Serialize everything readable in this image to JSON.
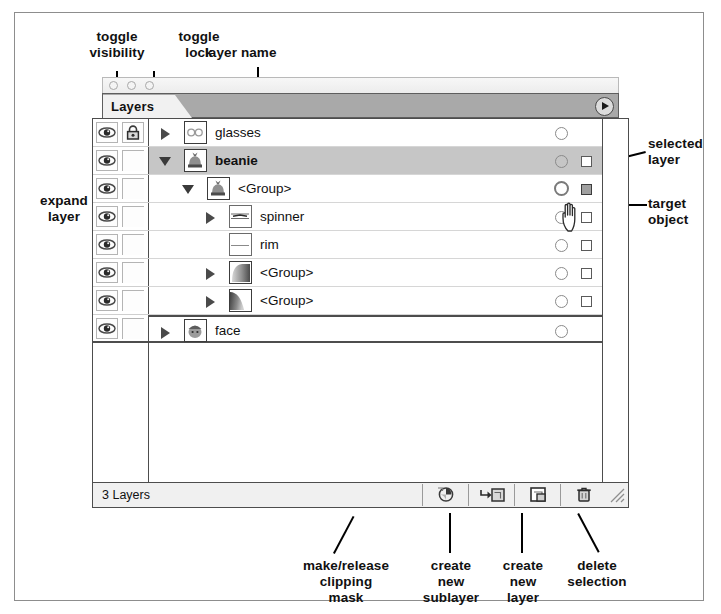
{
  "figure": {
    "application": "Adobe Illustrator Layers palette",
    "annotations": {
      "toggle_visibility": "toggle\nvisibility",
      "toggle_lock": "toggle\nlock",
      "layer_name": "layer name",
      "expand_layer": "expand\nlayer",
      "selected_layer": "selected\nlayer",
      "target_object": "target\nobject",
      "make_release_clipping_mask": "make/release\nclipping\nmask",
      "create_new_sublayer": "create\nnew\nsublayer",
      "create_new_layer": "create\nnew\nlayer",
      "delete_selection": "delete\nselection"
    }
  },
  "palette": {
    "tab_label": "Layers",
    "menu_arrow_icon": "triangle-right-icon",
    "window_dots": [
      "close-dot",
      "zoom-dot",
      "collapse-dot"
    ],
    "footer": {
      "layer_count": "3 Layers",
      "buttons": [
        {
          "name": "make-release-clipping-mask",
          "icon": "clipping-mask-icon"
        },
        {
          "name": "create-new-sublayer",
          "icon": "new-sublayer-icon"
        },
        {
          "name": "create-new-layer",
          "icon": "new-layer-icon"
        },
        {
          "name": "delete-selection",
          "icon": "trash-icon"
        }
      ],
      "resize_grip_icon": "resize-grip-icon"
    }
  },
  "layers": [
    {
      "name": "glasses",
      "indent": 0,
      "disclosure": "collapsed",
      "visible": true,
      "locked": true,
      "selected": false,
      "bold": false,
      "thumbnail": "glasses-thumbnail",
      "has_target_circle": true,
      "target_active": false,
      "has_selection_square": false,
      "selection_square_filled": false
    },
    {
      "name": "beanie",
      "indent": 0,
      "disclosure": "expanded",
      "visible": true,
      "locked": false,
      "selected": true,
      "bold": true,
      "thumbnail": "beanie-thumbnail",
      "has_target_circle": true,
      "target_active": false,
      "has_selection_square": true,
      "selection_square_filled": false
    },
    {
      "name": "<Group>",
      "indent": 1,
      "disclosure": "expanded",
      "visible": true,
      "locked": false,
      "selected": false,
      "bold": false,
      "thumbnail": "beanie-thumbnail",
      "has_target_circle": true,
      "target_active": true,
      "has_selection_square": true,
      "selection_square_filled": true
    },
    {
      "name": "spinner",
      "indent": 2,
      "disclosure": "collapsed",
      "visible": true,
      "locked": false,
      "selected": false,
      "bold": false,
      "thumbnail": "spinner-thumbnail",
      "has_target_circle": true,
      "target_active": false,
      "has_selection_square": true,
      "selection_square_filled": false
    },
    {
      "name": "rim",
      "indent": 2,
      "disclosure": "none",
      "visible": true,
      "locked": false,
      "selected": false,
      "bold": false,
      "thumbnail": "rim-thumbnail",
      "has_target_circle": true,
      "target_active": false,
      "has_selection_square": true,
      "selection_square_filled": false
    },
    {
      "name": "<Group>",
      "indent": 2,
      "disclosure": "collapsed",
      "visible": true,
      "locked": false,
      "selected": false,
      "bold": false,
      "thumbnail": "gradient-thumbnail-a",
      "has_target_circle": true,
      "target_active": false,
      "has_selection_square": true,
      "selection_square_filled": false
    },
    {
      "name": "<Group>",
      "indent": 2,
      "disclosure": "collapsed",
      "visible": true,
      "locked": false,
      "selected": false,
      "bold": false,
      "thumbnail": "gradient-thumbnail-b",
      "has_target_circle": true,
      "target_active": false,
      "has_selection_square": true,
      "selection_square_filled": false
    },
    {
      "name": "face",
      "indent": 0,
      "disclosure": "collapsed",
      "visible": true,
      "locked": false,
      "selected": false,
      "bold": false,
      "thumbnail": "face-thumbnail",
      "has_target_circle": true,
      "target_active": false,
      "has_selection_square": false,
      "selection_square_filled": false
    }
  ],
  "colors": {
    "selected_row": "#c6c6c6",
    "tab_bar": "#a9a9a9",
    "panel_border": "#4d4d4d",
    "text": "#111111"
  }
}
